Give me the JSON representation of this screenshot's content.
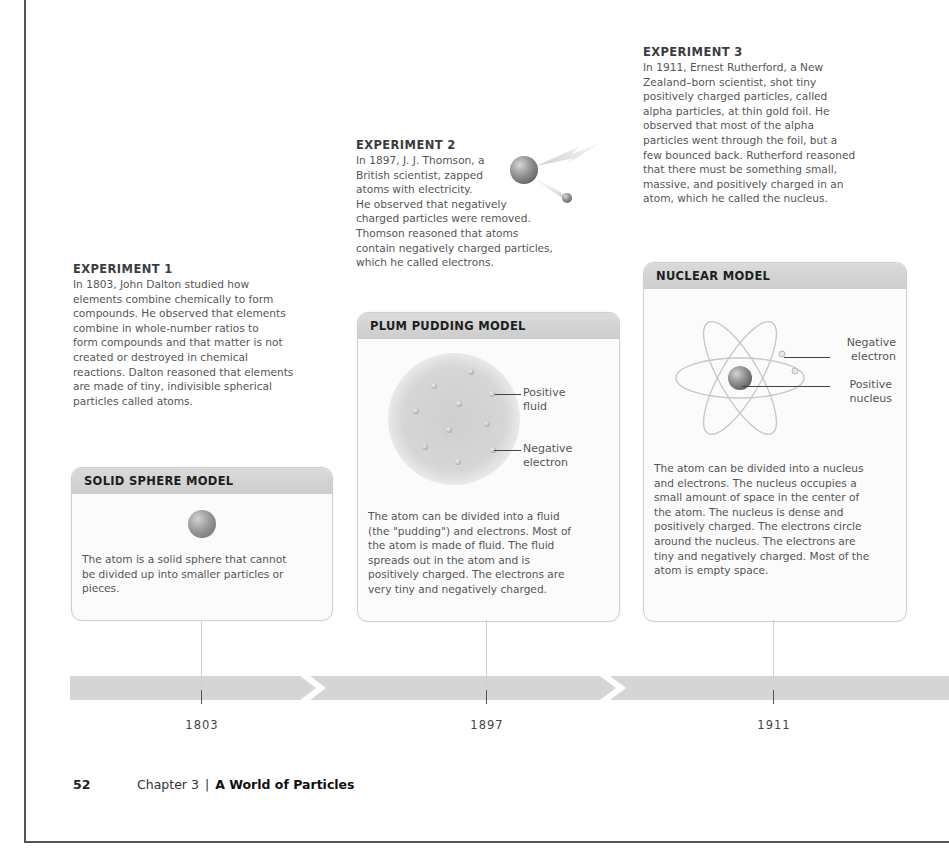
{
  "experiments": [
    {
      "title": "EXPERIMENT 1",
      "text": "In 1803, John Dalton studied how\nelements combine chemically to form\ncompounds. He observed that elements\ncombine in whole-number ratios to\nform compounds and that matter is not\ncreated or destroyed in chemical\nreactions. Dalton reasoned that elements\nare made of tiny, indivisible spherical\nparticles called atoms."
    },
    {
      "title": "EXPERIMENT 2",
      "text_top": "In 1897, J. J. Thomson, a\nBritish scientist, zapped\natoms with electricity.",
      "text_bottom": "He observed that negatively\ncharged particles were removed.\nThomson reasoned that atoms\ncontain negatively charged particles,\nwhich he called electrons."
    },
    {
      "title": "EXPERIMENT 3",
      "text": "In 1911, Ernest Rutherford, a New\nZealand–born scientist, shot tiny\npositively charged particles, called\nalpha particles, at thin gold foil. He\nobserved that most of the alpha\nparticles went through the foil, but a\nfew bounced back. Rutherford reasoned\nthat there must be something small,\nmassive, and positively charged in an\natom, which he called the nucleus."
    }
  ],
  "models": [
    {
      "title": "SOLID SPHERE MODEL",
      "text": "The atom is a solid sphere that cannot\nbe divided up into smaller particles or\npieces."
    },
    {
      "title": "PLUM PUDDING MODEL",
      "labels": {
        "fluid": "Positive\nfluid",
        "electron": "Negative\nelectron"
      },
      "text": "The atom can be divided into a fluid\n(the \"pudding\") and electrons. Most of\nthe atom is made of fluid. The fluid\nspreads out in the atom and is\npositively charged. The electrons are\nvery tiny and negatively charged."
    },
    {
      "title": "NUCLEAR MODEL",
      "labels": {
        "electron": "Negative\nelectron",
        "nucleus": "Positive\nnucleus"
      },
      "text": "The atom can be divided into a nucleus\nand electrons. The nucleus occupies a\nsmall amount of space in the center of\nthe atom. The nucleus is dense and\npositively charged. The electrons circle\naround the nucleus. The electrons are\ntiny and negatively charged. Most of the\natom is empty space."
    }
  ],
  "timeline": {
    "years": [
      "1803",
      "1897",
      "1911"
    ]
  },
  "footer": {
    "page_number": "52",
    "chapter": "Chapter 3",
    "separator": "|",
    "chapter_title": "A World of Particles"
  },
  "colors": {
    "card_header": "#d3d3d3",
    "timeline_bar": "#d5d5d5",
    "text": "#555555"
  }
}
